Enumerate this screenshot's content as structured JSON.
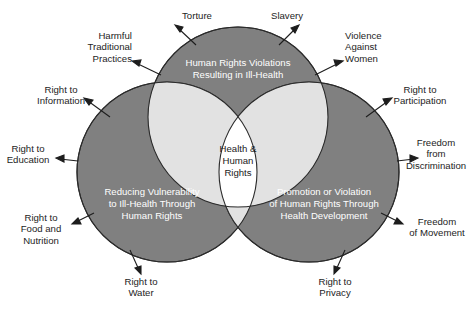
{
  "diagram": {
    "type": "venn-3-circle",
    "title": "Health & Human Rights",
    "colors": {
      "circle_fill": "#808080",
      "pair_overlap_fill": "#e2e2e2",
      "center_fill": "#ffffff",
      "stroke": "#2b2b2b",
      "background": "#ffffff",
      "circle_text": "#ffffff",
      "label_text": "#1d1d1d"
    },
    "center": {
      "lines": [
        "Health &",
        "Human",
        "Rights"
      ]
    },
    "circles": [
      {
        "id": "top",
        "name": "human-rights-violations",
        "lines": [
          "Human Rights Violations",
          "Resulting in Ill-Health"
        ]
      },
      {
        "id": "left",
        "name": "reducing-vulnerability",
        "lines": [
          "Reducing Vulnerability",
          "to Ill-Health Through",
          "Human Rights"
        ]
      },
      {
        "id": "right",
        "name": "promotion-or-violation",
        "lines": [
          "Promotion or Violation",
          "of Human Rights Through",
          "Health Development"
        ]
      }
    ],
    "callouts": [
      {
        "id": "torture",
        "lines": [
          "Torture"
        ]
      },
      {
        "id": "slavery",
        "lines": [
          "Slavery"
        ]
      },
      {
        "id": "harmful-traditional-practices",
        "lines": [
          "Harmful",
          "Traditional",
          "Practices"
        ]
      },
      {
        "id": "violence-against-women",
        "lines": [
          "Violence",
          "Against",
          "Women"
        ]
      },
      {
        "id": "right-to-information",
        "lines": [
          "Right to",
          "Information"
        ]
      },
      {
        "id": "right-to-participation",
        "lines": [
          "Right to",
          "Participation"
        ]
      },
      {
        "id": "right-to-education",
        "lines": [
          "Right to",
          "Education"
        ]
      },
      {
        "id": "freedom-from-discrimination",
        "lines": [
          "Freedom",
          "from",
          "Discrimination"
        ]
      },
      {
        "id": "right-to-food-and-nutrition",
        "lines": [
          "Right to",
          "Food and",
          "Nutrition"
        ]
      },
      {
        "id": "freedom-of-movement",
        "lines": [
          "Freedom",
          "of Movement"
        ]
      },
      {
        "id": "right-to-water",
        "lines": [
          "Right to",
          "Water"
        ]
      },
      {
        "id": "right-to-privacy",
        "lines": [
          "Right to",
          "Privacy"
        ]
      }
    ]
  }
}
